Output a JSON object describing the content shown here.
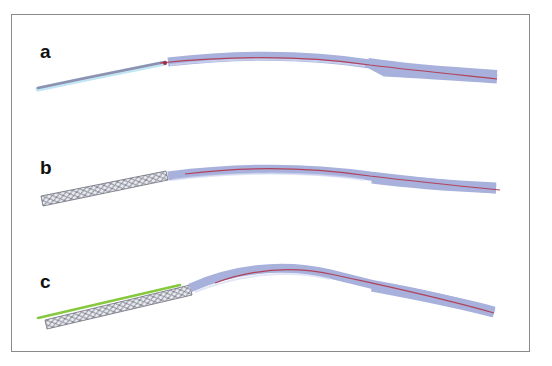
{
  "figure": {
    "panels": [
      {
        "label": "a",
        "description": "vessel model with catheter, no stent"
      },
      {
        "label": "b",
        "description": "vessel model with stent (mesh) at proximal segment"
      },
      {
        "label": "c",
        "description": "vessel model with stent and green guide line, increased curvature"
      }
    ]
  },
  "colors": {
    "frame": "#8a8a8a",
    "vessel_fill": "#a7b1dc",
    "vessel_light": "#c9d3ee",
    "centerline": "#b2425a",
    "stent_mesh": "#6d6f7a",
    "guide_line": "#86c83e",
    "thin_segment_glow": "#bfe6f2"
  }
}
